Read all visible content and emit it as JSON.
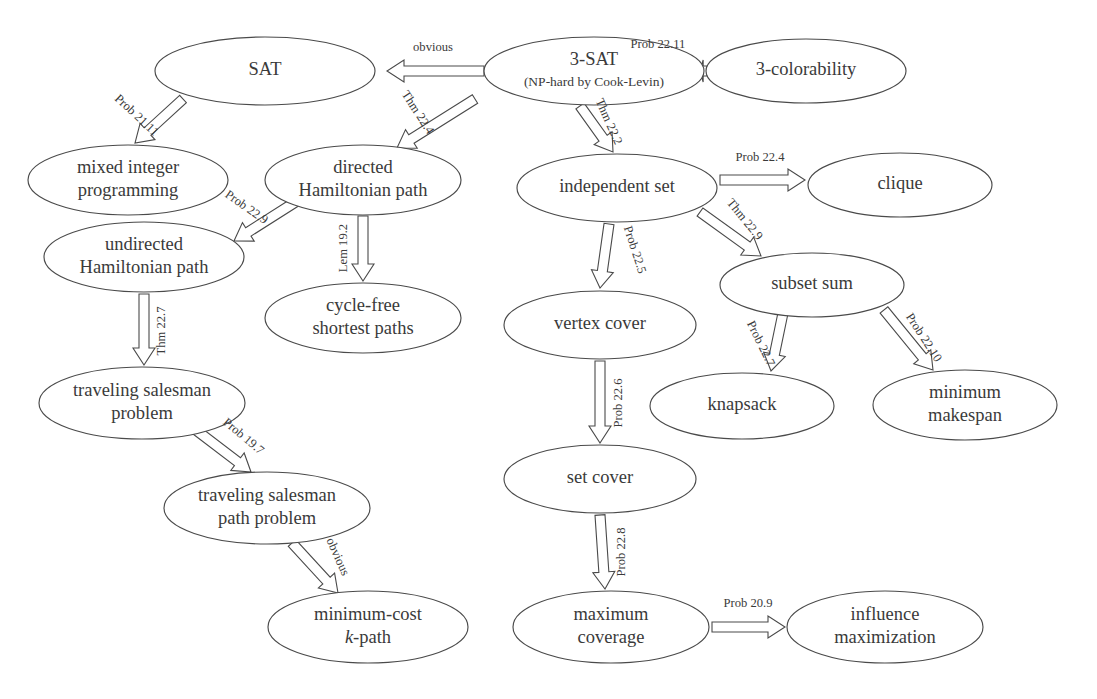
{
  "diagram": {
    "type": "directed-graph",
    "background_color": "#ffffff",
    "node_stroke_color": "#4a4a4a",
    "text_color": "#3a3a3a",
    "nodes": [
      {
        "id": "sat",
        "label": "SAT",
        "label2": "",
        "cx": 265,
        "cy": 71,
        "rx": 110,
        "ry": 34
      },
      {
        "id": "threesat",
        "label": "3-SAT",
        "label2": "(NP-hard by Cook-Levin)",
        "cx": 594,
        "cy": 71,
        "rx": 110,
        "ry": 34
      },
      {
        "id": "threecolor",
        "label": "3-colorability",
        "label2": "",
        "cx": 806,
        "cy": 71,
        "rx": 100,
        "ry": 32
      },
      {
        "id": "mip",
        "label": "mixed integer",
        "label2": "programming",
        "cx": 128,
        "cy": 180,
        "rx": 100,
        "ry": 35
      },
      {
        "id": "dirham",
        "label": "directed",
        "label2": "Hamiltonian path",
        "cx": 363,
        "cy": 180,
        "rx": 98,
        "ry": 35
      },
      {
        "id": "indset",
        "label": "independent set",
        "label2": "",
        "cx": 617,
        "cy": 188,
        "rx": 100,
        "ry": 34
      },
      {
        "id": "clique",
        "label": "clique",
        "label2": "",
        "cx": 900,
        "cy": 185,
        "rx": 92,
        "ry": 32
      },
      {
        "id": "undirham",
        "label": "undirected",
        "label2": "Hamiltonian path",
        "cx": 144,
        "cy": 257,
        "rx": 100,
        "ry": 35
      },
      {
        "id": "cyclefree",
        "label": "cycle-free",
        "label2": "shortest paths",
        "cx": 363,
        "cy": 318,
        "rx": 98,
        "ry": 35
      },
      {
        "id": "subsetsum",
        "label": "subset sum",
        "label2": "",
        "cx": 812,
        "cy": 285,
        "rx": 92,
        "ry": 32
      },
      {
        "id": "vertexcover",
        "label": "vertex cover",
        "label2": "",
        "cx": 600,
        "cy": 325,
        "rx": 96,
        "ry": 34
      },
      {
        "id": "tsp",
        "label": "traveling salesman",
        "label2": "problem",
        "cx": 142,
        "cy": 403,
        "rx": 103,
        "ry": 36
      },
      {
        "id": "knapsack",
        "label": "knapsack",
        "label2": "",
        "cx": 742,
        "cy": 406,
        "rx": 92,
        "ry": 33
      },
      {
        "id": "makespan",
        "label": "minimum",
        "label2": "makespan",
        "cx": 965,
        "cy": 405,
        "rx": 92,
        "ry": 35
      },
      {
        "id": "tsppath",
        "label": "traveling salesman",
        "label2": "path problem",
        "cx": 267,
        "cy": 508,
        "rx": 103,
        "ry": 36
      },
      {
        "id": "setcover",
        "label": "set cover",
        "label2": "",
        "cx": 600,
        "cy": 479,
        "rx": 96,
        "ry": 34
      },
      {
        "id": "kpath",
        "label": "minimum-cost",
        "label2": "k-path",
        "label2_italic_prefix": "k",
        "cx": 368,
        "cy": 627,
        "rx": 100,
        "ry": 36
      },
      {
        "id": "maxcov",
        "label": "maximum",
        "label2": "coverage",
        "cx": 611,
        "cy": 627,
        "rx": 98,
        "ry": 36
      },
      {
        "id": "influence",
        "label": "influence",
        "label2": "maximization",
        "cx": 885,
        "cy": 627,
        "rx": 98,
        "ry": 36
      }
    ],
    "edges": [
      {
        "id": "e-3sat-sat",
        "from": "threesat",
        "to": "sat",
        "label": "obvious",
        "x1": 484,
        "y1": 71,
        "x2": 387,
        "y2": 71,
        "lx": 433,
        "ly": 48,
        "lrot": 0
      },
      {
        "id": "e-3sat-3color",
        "from": "threesat",
        "to": "threecolor",
        "label": "Prob 22.11",
        "x1": 707,
        "y1": 71,
        "x2": 700,
        "y2": 71,
        "lx": 658,
        "ly": 45,
        "lrot": 0
      },
      {
        "id": "e-sat-mip",
        "from": "sat",
        "to": "mip",
        "label": "Prob 21.11",
        "x1": 183,
        "y1": 99,
        "x2": 135,
        "y2": 143,
        "lx": 136,
        "ly": 116,
        "lrot": 43
      },
      {
        "id": "e-3sat-dirham",
        "from": "threesat",
        "to": "dirham",
        "label": "Thm 22.4",
        "x1": 475,
        "y1": 99,
        "x2": 397,
        "y2": 148,
        "lx": 417,
        "ly": 113,
        "lrot": 57
      },
      {
        "id": "e-3sat-indset",
        "from": "threesat",
        "to": "indset",
        "label": "Thm 22.2",
        "x1": 580,
        "y1": 106,
        "x2": 613,
        "y2": 152,
        "lx": 608,
        "ly": 122,
        "lrot": 66
      },
      {
        "id": "e-dirham-undirham",
        "from": "dirham",
        "to": "undirham",
        "label": "Prob 22.9",
        "x1": 297,
        "y1": 201,
        "x2": 234,
        "y2": 241,
        "lx": 246,
        "ly": 208,
        "lrot": 35
      },
      {
        "id": "e-dirham-cyclefree",
        "from": "dirham",
        "to": "cyclefree",
        "label": "Lem 19.2",
        "x1": 363,
        "y1": 216,
        "x2": 363,
        "y2": 281,
        "lx": 344,
        "ly": 248,
        "lrot": -90
      },
      {
        "id": "e-indset-clique",
        "from": "indset",
        "to": "clique",
        "label": "Prob 22.4",
        "x1": 720,
        "y1": 180,
        "x2": 805,
        "y2": 180,
        "lx": 760,
        "ly": 158,
        "lrot": 0
      },
      {
        "id": "e-indset-subsetsum",
        "from": "indset",
        "to": "subsetsum",
        "label": "Thm 22.9",
        "x1": 700,
        "y1": 212,
        "x2": 761,
        "y2": 256,
        "lx": 744,
        "ly": 220,
        "lrot": 51
      },
      {
        "id": "e-indset-vertexcover",
        "from": "indset",
        "to": "vertexcover",
        "label": "Prob 22.5",
        "x1": 609,
        "y1": 224,
        "x2": 600,
        "y2": 288,
        "lx": 634,
        "ly": 250,
        "lrot": 72
      },
      {
        "id": "e-undirham-tsp",
        "from": "undirham",
        "to": "tsp",
        "label": "Thm 22.7",
        "x1": 144,
        "y1": 294,
        "x2": 144,
        "y2": 365,
        "lx": 162,
        "ly": 331,
        "lrot": -90
      },
      {
        "id": "e-subsetsum-knapsack",
        "from": "subsetsum",
        "to": "knapsack",
        "label": "Prob 22.7",
        "x1": 783,
        "y1": 313,
        "x2": 771,
        "y2": 371,
        "lx": 760,
        "ly": 344,
        "lrot": 64
      },
      {
        "id": "e-subsetsum-makespan",
        "from": "subsetsum",
        "to": "makespan",
        "label": "Prob 22.10",
        "x1": 884,
        "y1": 310,
        "x2": 933,
        "y2": 370,
        "lx": 923,
        "ly": 338,
        "lrot": 57
      },
      {
        "id": "e-vertexcover-setcover",
        "from": "vertexcover",
        "to": "setcover",
        "label": "Prob 22.6",
        "x1": 600,
        "y1": 361,
        "x2": 600,
        "y2": 443,
        "lx": 619,
        "ly": 403,
        "lrot": -90
      },
      {
        "id": "e-tsp-tsppath",
        "from": "tsp",
        "to": "tsppath",
        "label": "Prob 19.7",
        "x1": 196,
        "y1": 430,
        "x2": 251,
        "y2": 472,
        "lx": 243,
        "ly": 437,
        "lrot": 40
      },
      {
        "id": "e-setcover-maxcov",
        "from": "setcover",
        "to": "maxcov",
        "label": "Prob 22.8",
        "x1": 600,
        "y1": 515,
        "x2": 605,
        "y2": 589,
        "lx": 622,
        "ly": 552,
        "lrot": -90
      },
      {
        "id": "e-tsppath-kpath",
        "from": "tsppath",
        "to": "kpath",
        "label": "obvious",
        "x1": 292,
        "y1": 543,
        "x2": 338,
        "y2": 593,
        "lx": 337,
        "ly": 557,
        "lrot": 66
      },
      {
        "id": "e-maxcov-influence",
        "from": "maxcov",
        "to": "influence",
        "label": "Prob 20.9",
        "x1": 712,
        "y1": 627,
        "x2": 785,
        "y2": 627,
        "lx": 748,
        "ly": 604,
        "lrot": 0
      }
    ]
  }
}
